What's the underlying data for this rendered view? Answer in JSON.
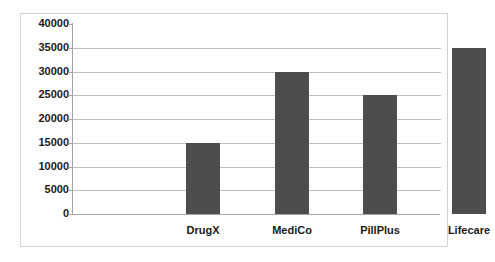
{
  "chart_data": {
    "type": "bar",
    "title": "",
    "subtitle": "",
    "xlabel": "",
    "ylabel": "",
    "categories": [
      "DrugX",
      "MediCo",
      "PillPlus",
      "Lifecare"
    ],
    "values": [
      15000,
      30000,
      25000,
      35000
    ],
    "series": [
      {
        "name": "",
        "values": [
          15000,
          30000,
          25000,
          35000
        ]
      }
    ],
    "ylim": [
      0,
      40000
    ],
    "ytick_step": 5000,
    "ytick_labels": [
      "40000",
      "35000",
      "30000",
      "25000",
      "20000",
      "15000",
      "10000",
      "5000",
      "0"
    ],
    "ytick_values": [
      40000,
      35000,
      30000,
      25000,
      20000,
      15000,
      10000,
      5000,
      0
    ],
    "grid": true,
    "grid_axis": "y",
    "legend": false,
    "legend_position": "none",
    "annotations": [],
    "colors": {
      "bar": "#4d4d4d",
      "gridline": "#bfbfbf",
      "axis": "#a6a6a6",
      "frame_border": "#d2d2d2",
      "text": "#1a1a1a",
      "background": "#ffffff"
    }
  }
}
